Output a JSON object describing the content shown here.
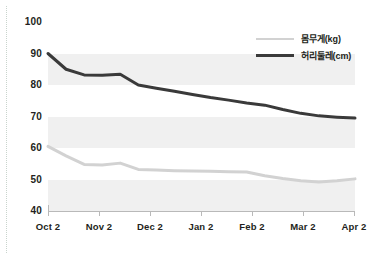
{
  "chart_data": {
    "type": "line",
    "title": "",
    "xlabel": "",
    "ylabel": "",
    "x": [
      "Oct 2",
      "Nov 2",
      "Dec 2",
      "Jan 2",
      "Feb 2",
      "Mar 2",
      "Apr 2"
    ],
    "categories": [
      "Oct 2",
      "Nov 2",
      "Dec 2",
      "Jan 2",
      "Feb 2",
      "Mar 2",
      "Apr 2"
    ],
    "ylim": [
      40,
      100
    ],
    "yticks": [
      40,
      50,
      60,
      70,
      80,
      90,
      100
    ],
    "grid": false,
    "banding": "alternating horizontal gray bands on 40-50, 60-70, 80-90",
    "legend_position": "top-right",
    "series": [
      {
        "name": "몸무게(kg)",
        "color": "#d2d2d2",
        "values": [
          60.5,
          54.8,
          53.2,
          52.7,
          52.4,
          49.2,
          50.2
        ],
        "dense_points": [
          60.5,
          57.5,
          54.8,
          54.6,
          55.2,
          53.2,
          53.0,
          52.8,
          52.7,
          52.6,
          52.5,
          52.4,
          51.2,
          50.3,
          49.6,
          49.2,
          49.6,
          50.2
        ]
      },
      {
        "name": "허리둘레(cm)",
        "color": "#3a3a3a",
        "values": [
          90.0,
          83.2,
          80.0,
          77.0,
          74.3,
          70.2,
          69.5
        ],
        "dense_points": [
          90.0,
          85.0,
          83.2,
          83.1,
          83.4,
          80.0,
          79.0,
          78.0,
          77.0,
          76.0,
          75.2,
          74.3,
          73.6,
          72.2,
          71.0,
          70.2,
          69.8,
          69.5
        ]
      }
    ]
  },
  "axis": {
    "y_tick_labels": [
      "100",
      "90",
      "80",
      "70",
      "60",
      "50",
      "40"
    ],
    "x_tick_labels": [
      "Oct 2",
      "Nov 2",
      "Dec 2",
      "Jan 2",
      "Feb 2",
      "Mar 2",
      "Apr 2"
    ]
  },
  "legend": {
    "items": [
      {
        "label": "몸무게(kg)",
        "color": "#d2d2d2"
      },
      {
        "label": "허리둘레(cm)",
        "color": "#3a3a3a"
      }
    ]
  },
  "colors": {
    "weight_line": "#d2d2d2",
    "waist_line": "#3a3a3a",
    "band": "#f0f0f0",
    "axis": "#b9b9b9",
    "text": "#231f20",
    "background": "#ffffff"
  }
}
